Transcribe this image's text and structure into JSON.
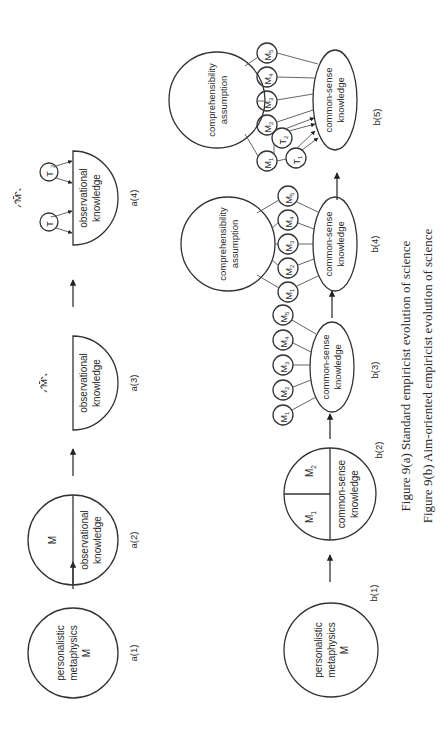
{
  "figure": {
    "caption_a": "Figure 9(a)  Standard empiricist evolution of science",
    "caption_b": "Figure 9(b)  Aim-oriented empiricist evolution of science"
  },
  "row_a": {
    "stages": [
      {
        "label": "a(1)",
        "lines": [
          "personalistic",
          "metaphysics",
          "M"
        ]
      },
      {
        "label": "a(2)",
        "top": "M",
        "bottom_lines": [
          "observational",
          "knowledge"
        ]
      },
      {
        "label": "a(3)",
        "dashed": "M",
        "lines": [
          "observational",
          "knowledge"
        ]
      },
      {
        "label": "a(4)",
        "dashed": "M",
        "theories": [
          "T1",
          "T2"
        ],
        "lines": [
          "observational",
          "knowledge"
        ]
      }
    ]
  },
  "row_b": {
    "stages": [
      {
        "label": "b(1)",
        "lines": [
          "personalistic",
          "metaphysics",
          "M"
        ]
      },
      {
        "label": "b(2)",
        "top_left": "M1",
        "top_right": "M2",
        "bottom_lines": [
          "common-sense",
          "knowledge"
        ]
      },
      {
        "label": "b(3)",
        "metaphysics": [
          "M1",
          "M2",
          "M3",
          "M4",
          "M5"
        ],
        "lines": [
          "common-sense",
          "knowledge"
        ]
      },
      {
        "label": "b(4)",
        "assumption_lines": [
          "comprehensibility",
          "assumption"
        ],
        "metaphysics": [
          "M1",
          "M2",
          "M3",
          "M4",
          "M5"
        ],
        "lines": [
          "common-sense",
          "knowledge"
        ]
      },
      {
        "label": "b(5)",
        "assumption_lines": [
          "comprehensibility",
          "assumption"
        ],
        "metaphysics": [
          "M1",
          "M2",
          "M3",
          "M4",
          "M5"
        ],
        "theories": [
          "T1",
          "T2"
        ],
        "lines": [
          "common-sense",
          "knowledge"
        ]
      }
    ]
  },
  "symbols": {
    "M": "M",
    "T": "T",
    "sub": [
      "1",
      "2",
      "3",
      "4",
      "5"
    ]
  }
}
